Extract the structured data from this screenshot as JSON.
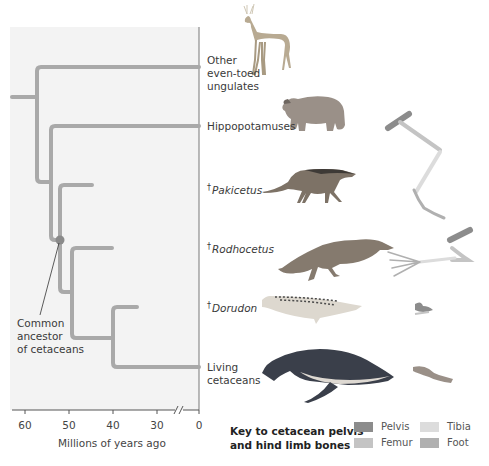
{
  "figure": {
    "axis": {
      "title": "Millions of years ago",
      "ticks": [
        {
          "label": "60",
          "x": 25
        },
        {
          "label": "50",
          "x": 69
        },
        {
          "label": "40",
          "x": 113
        },
        {
          "label": "30",
          "x": 157
        },
        {
          "label": "0",
          "x": 199
        }
      ],
      "break_mark": "//"
    },
    "taxa": [
      {
        "id": "ungulates",
        "extinct": false,
        "lines": [
          "Other",
          "even-toed",
          "ungulates"
        ],
        "italic": false
      },
      {
        "id": "hippos",
        "extinct": false,
        "lines": [
          "Hippopotamuses"
        ],
        "italic": false
      },
      {
        "id": "pakicetus",
        "extinct": true,
        "lines": [
          "Pakicetus"
        ],
        "italic": true
      },
      {
        "id": "rodhocetus",
        "extinct": true,
        "lines": [
          "Rodhocetus"
        ],
        "italic": true
      },
      {
        "id": "dorudon",
        "extinct": true,
        "lines": [
          "Dorudon"
        ],
        "italic": true
      },
      {
        "id": "living",
        "extinct": false,
        "lines": [
          "Living",
          "cetaceans"
        ],
        "italic": false
      }
    ],
    "dagger": "†",
    "annotation": {
      "lines": [
        "Common",
        "ancestor",
        "of cetaceans"
      ]
    },
    "key": {
      "title_line1": "Key to cetacean pelvis",
      "title_line2": "and hind limb bones",
      "items": [
        {
          "label": "Pelvis",
          "color": "#8c8c8c"
        },
        {
          "label": "Tibia",
          "color": "#dcdcdc"
        },
        {
          "label": "Femur",
          "color": "#c4c4c4"
        },
        {
          "label": "Foot",
          "color": "#b0b0b0"
        }
      ]
    },
    "colors": {
      "branch": "#a9a9a9",
      "panel_bg": "#f3f3f3",
      "node_dot": "#8a8a8a",
      "axis": "#555555"
    }
  }
}
